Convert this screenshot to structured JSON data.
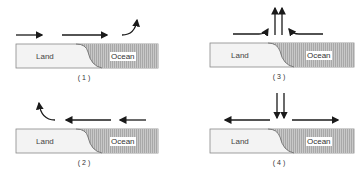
{
  "diagram": {
    "panels": [
      {
        "id": "1",
        "caption": "( 1 )",
        "land_label": "Land",
        "ocean_label": "Ocean",
        "airflow": "land-to-ocean, rising over ocean"
      },
      {
        "id": "2",
        "caption": "( 2 )",
        "land_label": "Land",
        "ocean_label": "Ocean",
        "airflow": "ocean-to-land, rising over land"
      },
      {
        "id": "3",
        "caption": "( 3 )",
        "land_label": "Land",
        "ocean_label": "Ocean",
        "airflow": "converging at coast, rising"
      },
      {
        "id": "4",
        "caption": "( 4 )",
        "land_label": "Land",
        "ocean_label": "Ocean",
        "airflow": "sinking at coast, diverging"
      }
    ],
    "colors": {
      "land": "#f2f2f2",
      "ocean": "#bdbdbd",
      "arrow": "#1a1a1a",
      "outline": "#777777"
    }
  }
}
